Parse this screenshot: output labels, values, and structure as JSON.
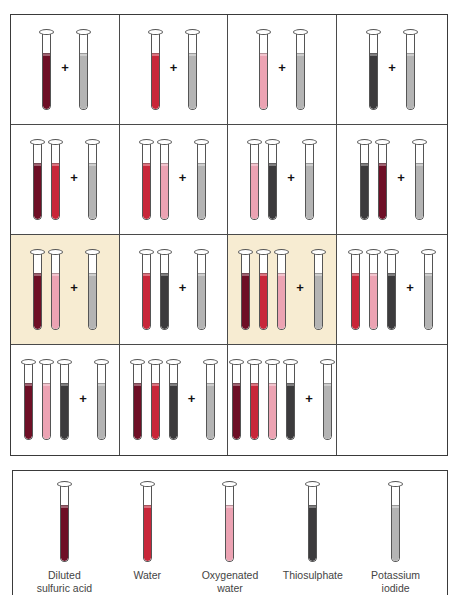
{
  "colors": {
    "diluted_sulfuric_acid": "#6e0f26",
    "water": "#c8273a",
    "oxygenated_water": "#eca3b3",
    "thiosulphate": "#3c3b3d",
    "potassium_iodide": "#b4b4b4",
    "highlight_background": "#f7ecd2"
  },
  "plus_symbol": "+",
  "grid": {
    "rows": 4,
    "columns": 4,
    "cells": [
      {
        "row": 1,
        "col": 1,
        "tubes": [
          "acid"
        ],
        "added": "ki",
        "highlighted": false
      },
      {
        "row": 1,
        "col": 2,
        "tubes": [
          "water"
        ],
        "added": "ki",
        "highlighted": false
      },
      {
        "row": 1,
        "col": 3,
        "tubes": [
          "oxy"
        ],
        "added": "ki",
        "highlighted": false
      },
      {
        "row": 1,
        "col": 4,
        "tubes": [
          "thio"
        ],
        "added": "ki",
        "highlighted": false
      },
      {
        "row": 2,
        "col": 1,
        "tubes": [
          "acid",
          "water"
        ],
        "added": "ki",
        "highlighted": false
      },
      {
        "row": 2,
        "col": 2,
        "tubes": [
          "water",
          "oxy"
        ],
        "added": "ki",
        "highlighted": false
      },
      {
        "row": 2,
        "col": 3,
        "tubes": [
          "oxy",
          "thio"
        ],
        "added": "ki",
        "highlighted": false
      },
      {
        "row": 2,
        "col": 4,
        "tubes": [
          "thio",
          "acid"
        ],
        "added": "ki",
        "highlighted": false
      },
      {
        "row": 3,
        "col": 1,
        "tubes": [
          "acid",
          "oxy"
        ],
        "added": "ki",
        "highlighted": true
      },
      {
        "row": 3,
        "col": 2,
        "tubes": [
          "water",
          "thio"
        ],
        "added": "ki",
        "highlighted": false
      },
      {
        "row": 3,
        "col": 3,
        "tubes": [
          "acid",
          "water",
          "oxy"
        ],
        "added": "ki",
        "highlighted": true
      },
      {
        "row": 3,
        "col": 4,
        "tubes": [
          "water",
          "oxy",
          "thio"
        ],
        "added": "ki",
        "highlighted": false
      },
      {
        "row": 4,
        "col": 1,
        "tubes": [
          "acid",
          "oxy",
          "thio"
        ],
        "added": "ki",
        "highlighted": false
      },
      {
        "row": 4,
        "col": 2,
        "tubes": [
          "acid",
          "water",
          "thio"
        ],
        "added": "ki",
        "highlighted": false
      },
      {
        "row": 4,
        "col": 3,
        "tubes": [
          "acid",
          "water",
          "oxy",
          "thio"
        ],
        "added": "ki",
        "highlighted": false
      },
      {
        "row": 4,
        "col": 4,
        "tubes": [],
        "added": null,
        "highlighted": false
      }
    ]
  },
  "legend": {
    "items": [
      {
        "key": "acid",
        "label": "Diluted\nsulfuric acid"
      },
      {
        "key": "water",
        "label": "Water"
      },
      {
        "key": "oxy",
        "label": "Oxygenated\nwater"
      },
      {
        "key": "thio",
        "label": "Thiosulphate"
      },
      {
        "key": "ki",
        "label": "Potassium\niodide"
      }
    ]
  }
}
